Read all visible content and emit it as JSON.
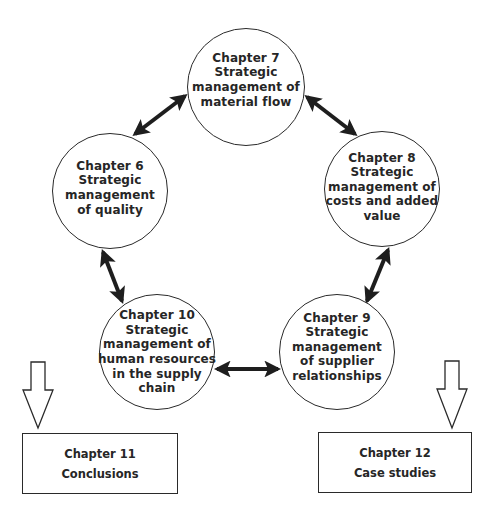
{
  "diagram": {
    "nodes": {
      "ch7": {
        "title": "Chapter 7",
        "lines": [
          "Strategic",
          "management of",
          "material flow"
        ]
      },
      "ch6": {
        "title": "Chapter 6",
        "lines": [
          "Strategic",
          "management",
          "of quality"
        ]
      },
      "ch8": {
        "title": "Chapter 8",
        "lines": [
          "Strategic",
          "management of",
          "costs and added",
          "value"
        ]
      },
      "ch10": {
        "title": "Chapter 10",
        "lines": [
          "Strategic",
          "management of",
          "human resources",
          "in the supply",
          "chain"
        ]
      },
      "ch9": {
        "title": "Chapter 9",
        "lines": [
          "Strategic",
          "management",
          "of supplier",
          "relationships"
        ]
      }
    },
    "boxes": {
      "ch11": {
        "title": "Chapter 11",
        "subtitle": "Conclusions"
      },
      "ch12": {
        "title": "Chapter 12",
        "subtitle": "Case studies"
      }
    },
    "connections": [
      {
        "from": "Chapter 7",
        "to": "Chapter 6",
        "type": "double-arrow"
      },
      {
        "from": "Chapter 7",
        "to": "Chapter 8",
        "type": "double-arrow"
      },
      {
        "from": "Chapter 6",
        "to": "Chapter 10",
        "type": "double-arrow"
      },
      {
        "from": "Chapter 8",
        "to": "Chapter 9",
        "type": "double-arrow"
      },
      {
        "from": "Chapter 10",
        "to": "Chapter 9",
        "type": "double-arrow"
      }
    ],
    "flow_arrows": [
      {
        "to": "Chapter 11",
        "icon": "hollow-down-arrow"
      },
      {
        "to": "Chapter 12",
        "icon": "hollow-down-arrow"
      }
    ],
    "colors": {
      "stroke": "#2a2a2a",
      "arrow_fill": "#1e1e1e",
      "background": "#ffffff"
    }
  }
}
